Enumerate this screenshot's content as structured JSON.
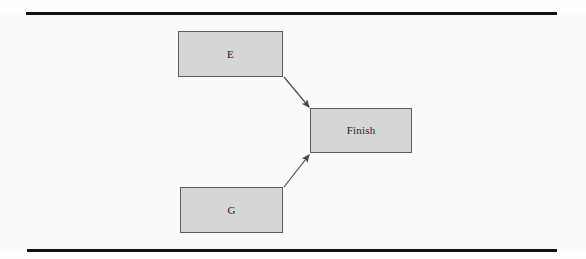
{
  "page": {
    "background_color": "#fafafa",
    "rule_color": "#111111"
  },
  "diagram": {
    "type": "flowchart",
    "title": "",
    "node_fill_color": "#d6d6d6",
    "node_border_color": "#5c5c5c",
    "edge_color": "#4a4a4a",
    "nodes": [
      {
        "id": "E",
        "label": "E",
        "x": 178,
        "y": 31,
        "width": 105,
        "height": 46
      },
      {
        "id": "G",
        "label": "G",
        "x": 180,
        "y": 187,
        "width": 103,
        "height": 46
      },
      {
        "id": "Finish",
        "label": "Finish",
        "x": 310,
        "y": 108,
        "width": 102,
        "height": 45
      }
    ],
    "edges": [
      {
        "from": "E",
        "to": "Finish",
        "label": "",
        "arrowhead": "filled-triangle"
      },
      {
        "from": "G",
        "to": "Finish",
        "label": "",
        "arrowhead": "filled-triangle"
      }
    ]
  }
}
